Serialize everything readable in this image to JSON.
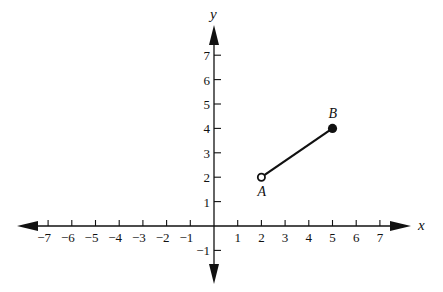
{
  "figure": {
    "type": "coordinate-plane",
    "x_axis": {
      "label": "x",
      "range": [
        -7,
        7
      ],
      "ticks": [
        -7,
        -6,
        -5,
        -4,
        -3,
        -2,
        -1,
        1,
        2,
        3,
        4,
        5,
        6,
        7
      ]
    },
    "y_axis": {
      "label": "y",
      "range": [
        -1,
        7
      ],
      "ticks": [
        -1,
        1,
        2,
        3,
        4,
        5,
        6,
        7
      ]
    },
    "segment": {
      "start": {
        "name": "A",
        "x": 2,
        "y": 2,
        "endpoint": "open"
      },
      "end": {
        "name": "B",
        "x": 5,
        "y": 4,
        "endpoint": "closed"
      }
    }
  },
  "layout": {
    "origin_px": [
      214,
      226
    ],
    "unit_x_px": 23.7,
    "unit_y_px": 24.4,
    "x_axis_px": [
      17,
      411
    ],
    "y_axis_px": [
      25,
      284
    ],
    "color": "#111111"
  }
}
